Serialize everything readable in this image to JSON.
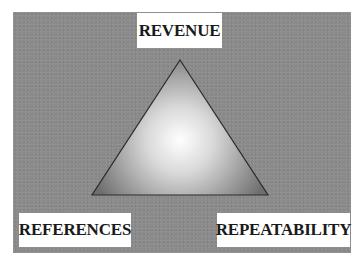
{
  "diagram": {
    "type": "triangle",
    "background_color": "#8b8b8b",
    "vertices": {
      "top": {
        "label": "REVENUE"
      },
      "bottom_left": {
        "label": "REFERENCES"
      },
      "bottom_right": {
        "label": "REPEATABILITY"
      }
    },
    "colors": {
      "triangle_center": "#ffffff",
      "triangle_edge": "#6a6a6a",
      "outline": "#2a2a2a",
      "label_background": "#ffffff",
      "label_text": "#1a1a1a"
    }
  }
}
